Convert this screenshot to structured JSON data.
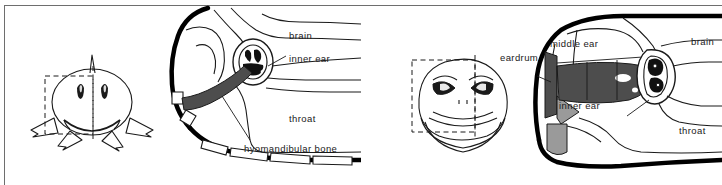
{
  "figure": {
    "panels": [
      {
        "id": "fish",
        "animal": "shark",
        "head_view": "frontal",
        "section_box": "dashed-cross-section-indicator",
        "labels": [
          {
            "key": "brain",
            "text": "brain"
          },
          {
            "key": "inner_ear",
            "text": "inner ear"
          },
          {
            "key": "throat",
            "text": "throat"
          },
          {
            "key": "hyomandibular_bone",
            "text": "hyomandibular bone"
          }
        ]
      },
      {
        "id": "frog",
        "animal": "frog",
        "head_view": "frontal",
        "section_box": "dashed-cross-section-indicator",
        "labels": [
          {
            "key": "eardrum",
            "text": "eardrum"
          },
          {
            "key": "middle_ear",
            "text": "middle ear"
          },
          {
            "key": "brain",
            "text": "brain"
          },
          {
            "key": "inner_ear",
            "text": "inner ear"
          },
          {
            "key": "throat",
            "text": "throat"
          }
        ]
      }
    ],
    "colors": {
      "ink": "#1a1a1a",
      "outline_heavy": "#000000",
      "bone_dark_grey": "#4d4d4d",
      "bone_mid_grey": "#9a9a9a",
      "frame": "#6e6e6e",
      "paper": "#ffffff"
    }
  }
}
